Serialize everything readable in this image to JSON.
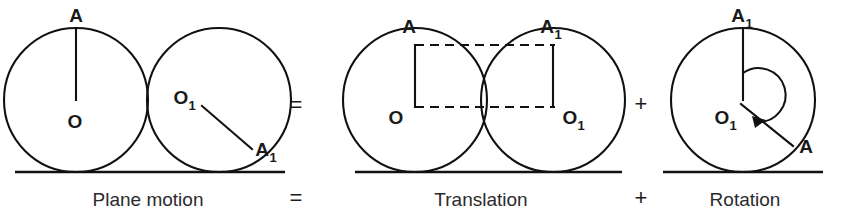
{
  "figure": {
    "background_color": "#ffffff",
    "stroke_color": "#111111"
  },
  "panels": [
    {
      "id": "plane-motion",
      "caption": "Plane motion",
      "labels": {
        "top_point": "A",
        "center_left": "O",
        "center_right": "O",
        "center_right_sub": "1",
        "moved_point": "A",
        "moved_point_sub": "1"
      }
    },
    {
      "id": "translation",
      "caption": "Translation",
      "labels": {
        "top_left_point": "A",
        "top_right_point": "A",
        "top_right_sub": "1",
        "center_left": "O",
        "center_right": "O",
        "center_right_sub": "1"
      }
    },
    {
      "id": "rotation",
      "caption": "Rotation",
      "labels": {
        "top_point": "A",
        "top_point_sub": "1",
        "center": "O",
        "center_sub": "1",
        "rotated_point": "A"
      }
    }
  ],
  "operators": {
    "equals_top": "=",
    "equals_bottom": "=",
    "plus_top": "+",
    "plus_bottom": "+"
  },
  "equation_text": "Plane motion = Translation + Rotation"
}
